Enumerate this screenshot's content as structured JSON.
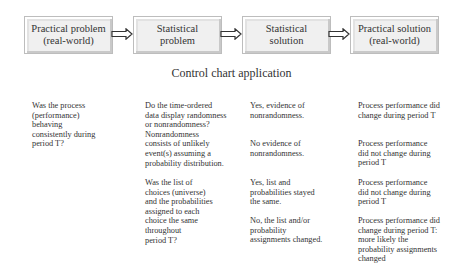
{
  "flow": {
    "boxes": [
      {
        "label": "Practical problem\n(real-world)"
      },
      {
        "label": "Statistical\nproblem"
      },
      {
        "label": "Statistical\nsolution"
      },
      {
        "label": "Practical solution\n(real-world)"
      }
    ],
    "arrow_icon": "double-line-right-arrow"
  },
  "title": "Control chart application",
  "table": {
    "question": "Was the process\n(performance)\nbehaving\nconsistently during\nperiod T?",
    "rows": [
      {
        "statistical_question": "Do the time-ordered\ndata display randomness\nor nonrandomness?\nNonrandomness\nconsists of unlikely\nevent(s) assuming a\nprobability distribution.",
        "answers": [
          {
            "statistical": "Yes, evidence of\nnonrandomness.",
            "practical": "Process performance did\nchange during period T"
          },
          {
            "statistical": "No evidence of\nnonrandomness.",
            "practical": "Process performance\ndid not change during\nperiod T"
          }
        ]
      },
      {
        "statistical_question": "Was the list of\nchoices (universe)\nand the probabilities\nassigned to each\nchoice the same\nthroughout\nperiod T?",
        "answers": [
          {
            "statistical": "Yes, list and\nprobabilities stayed\nthe same.",
            "practical": "Process performance\ndid not change during\nperiod T"
          },
          {
            "statistical": "No, the list and/or\nprobability\nassignments changed.",
            "practical": "Process performance did\nchange during period T:\nmore likely the\nprobability assignments\nchanged"
          }
        ]
      }
    ]
  }
}
